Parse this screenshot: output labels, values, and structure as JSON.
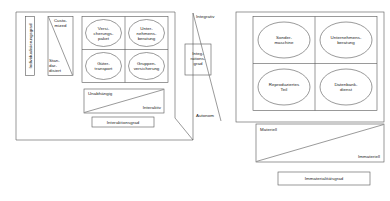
{
  "diagram": {
    "title_text": "",
    "stroke_color": "#555555",
    "text_color": "#1a1a1a",
    "background": "#ffffff"
  },
  "left_panel": {
    "y_axis_label": "Individualisierungsgrad",
    "x_axis_label": "Interaktionsgrad",
    "y_scale": {
      "top": "Custo-\nmized",
      "bottom": "Stan-\ndar-\ndisiert"
    },
    "x_scale": {
      "top_left": "Unabhängig",
      "bottom_right": "Interaktiv"
    },
    "matrix_cells": [
      {
        "label": "Versi-\ncherungs-\npaket"
      },
      {
        "label": "Unter-\nnehmens-\nberatung"
      },
      {
        "label": "Güter-\ntransport"
      },
      {
        "label": "Gruppen-\nversicherung"
      }
    ]
  },
  "center_axis": {
    "top_label": "Integrativ",
    "bottom_label": "Autonom",
    "box_label": "Integ-\nrations-\ngrad"
  },
  "right_panel": {
    "x_axis_label": "Immaterialitätsgrad",
    "x_scale": {
      "top_left": "Materiell",
      "bottom_right": "Immateriell"
    },
    "matrix_cells": [
      {
        "label": "Sonder-\nmaschine"
      },
      {
        "label": "Unternehmens-\nberatung"
      },
      {
        "label": "Reproduziertes\nTeil"
      },
      {
        "label": "Datenbank-\ndienst"
      }
    ]
  }
}
